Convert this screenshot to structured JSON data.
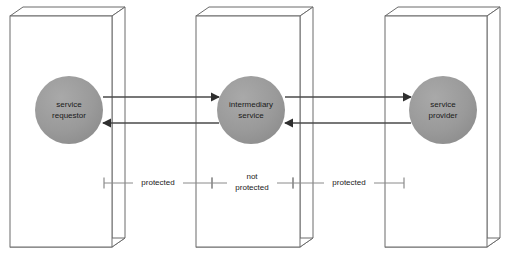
{
  "diagram": {
    "background_color": "#ffffff",
    "box_stroke_color": "#6b6b6b",
    "node_fill_color": "#999999",
    "arrow_color": "#4a4a4a",
    "bracket_color": "#8a8a8a",
    "text_color": "#1a1a1a",
    "containers": [
      {
        "id": "container-requestor",
        "name": "service-requestor-container",
        "front": {
          "x": 10,
          "y": 16,
          "width": 102,
          "height": 231
        },
        "depth_x": 13,
        "depth_y": 9
      },
      {
        "id": "container-intermediary",
        "name": "intermediary-service-container",
        "front": {
          "x": 196,
          "y": 16,
          "width": 104,
          "height": 231
        },
        "depth_x": 13,
        "depth_y": 9
      },
      {
        "id": "container-provider",
        "name": "service-provider-container",
        "front": {
          "x": 385,
          "y": 16,
          "width": 102,
          "height": 231
        },
        "depth_x": 13,
        "depth_y": 9
      }
    ],
    "nodes": [
      {
        "id": "node-requestor",
        "name": "service-requestor-node",
        "label_line1": "service",
        "label_line2": "requestor",
        "cx": 69,
        "cy": 110,
        "r": 34
      },
      {
        "id": "node-intermediary",
        "name": "intermediary-service-node",
        "label_line1": "intermediary",
        "label_line2": "service",
        "cx": 251,
        "cy": 110,
        "r": 34
      },
      {
        "id": "node-provider",
        "name": "service-provider-node",
        "label_line1": "service",
        "label_line2": "provider",
        "cx": 443,
        "cy": 110,
        "r": 34
      }
    ],
    "flows": [
      {
        "id": "flow-request-out",
        "name": "request-arrow-requestor-to-intermediary",
        "from_x": 103,
        "to_x": 219,
        "y": 97,
        "direction": "right"
      },
      {
        "id": "flow-response-back",
        "name": "response-arrow-intermediary-to-requestor",
        "from_x": 219,
        "to_x": 103,
        "y": 123,
        "direction": "left"
      },
      {
        "id": "flow-request-forward",
        "name": "request-arrow-intermediary-to-provider",
        "from_x": 285,
        "to_x": 411,
        "y": 97,
        "direction": "right"
      },
      {
        "id": "flow-response-return",
        "name": "response-arrow-provider-to-intermediary",
        "from_x": 411,
        "to_x": 285,
        "y": 123,
        "direction": "left"
      }
    ],
    "brackets": [
      {
        "id": "bracket-protected-left",
        "name": "protected-span-left",
        "label": "protected",
        "label_line2": "",
        "x1": 104,
        "x2": 212,
        "y": 183,
        "tick_height": 11,
        "label_x": 158,
        "label_y": 183
      },
      {
        "id": "bracket-not-protected",
        "name": "not-protected-span-middle",
        "label": "not",
        "label_line2": "protected",
        "x1": 212,
        "x2": 293,
        "y": 183,
        "tick_height": 11,
        "label_x": 252,
        "label_y": 177
      },
      {
        "id": "bracket-protected-right",
        "name": "protected-span-right",
        "label": "protected",
        "label_line2": "",
        "x1": 293,
        "x2": 404,
        "y": 183,
        "tick_height": 11,
        "label_x": 349,
        "label_y": 183
      }
    ]
  }
}
